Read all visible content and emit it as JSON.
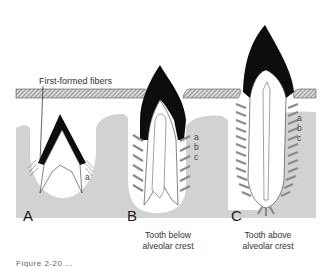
{
  "figure": {
    "annotation": "First-formed fibers",
    "panels": [
      {
        "letter": "A",
        "caption_line1": "",
        "caption_line2": "",
        "fiber_labels": [
          "a"
        ]
      },
      {
        "letter": "B",
        "caption_line1": "Tooth below",
        "caption_line2": "alveolar crest",
        "fiber_labels": [
          "a",
          "b",
          "c"
        ]
      },
      {
        "letter": "C",
        "caption_line1": "Tooth above",
        "caption_line2": "alveolar crest",
        "fiber_labels": [
          "a",
          "b",
          "c"
        ]
      }
    ],
    "cut_caption": "Figure 2-20 ...",
    "colors": {
      "bone": "#d4d4d4",
      "enamel": "#0d0d0d",
      "epithelium_hatch": "#9a9a9a",
      "fiber": "#8a8a8a",
      "background": "#ffffff"
    }
  }
}
